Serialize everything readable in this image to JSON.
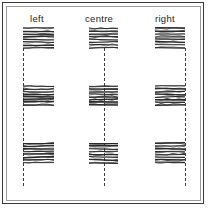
{
  "figure": {
    "background_color": "#ffffff",
    "border_color": "#3a3a3a",
    "inner_border_color": "#9a9a9a",
    "ink_color": "#2a2a2a",
    "guide_color": "#3c3c3c",
    "width": 208,
    "height": 208
  },
  "columns": [
    {
      "id": "left",
      "label": "left",
      "label_x": 30,
      "label_y": 14,
      "align": "left",
      "guide_x": 23,
      "guide_top": 48,
      "guide_bottom": 186,
      "blocks": [
        {
          "x": 23,
          "y": 27,
          "w": 31,
          "h": 22,
          "lines": 8
        },
        {
          "x": 23,
          "y": 85,
          "w": 31,
          "h": 21,
          "lines": 8
        },
        {
          "x": 23,
          "y": 142,
          "w": 31,
          "h": 22,
          "lines": 8
        }
      ]
    },
    {
      "id": "centre",
      "label": "centre",
      "label_x": 85,
      "label_y": 14,
      "align": "centre",
      "guide_x": 104,
      "guide_top": 48,
      "guide_bottom": 186,
      "blocks": [
        {
          "x": 89,
          "y": 27,
          "w": 29,
          "h": 22,
          "lines": 8
        },
        {
          "x": 89,
          "y": 85,
          "w": 29,
          "h": 21,
          "lines": 8
        },
        {
          "x": 89,
          "y": 142,
          "w": 29,
          "h": 22,
          "lines": 8
        }
      ]
    },
    {
      "id": "right",
      "label": "right",
      "label_x": 155,
      "label_y": 14,
      "align": "right",
      "guide_x": 185,
      "guide_top": 48,
      "guide_bottom": 186,
      "blocks": [
        {
          "x": 155,
          "y": 27,
          "w": 30,
          "h": 22,
          "lines": 8
        },
        {
          "x": 155,
          "y": 85,
          "w": 30,
          "h": 21,
          "lines": 8
        },
        {
          "x": 155,
          "y": 142,
          "w": 30,
          "h": 22,
          "lines": 8
        }
      ]
    }
  ]
}
